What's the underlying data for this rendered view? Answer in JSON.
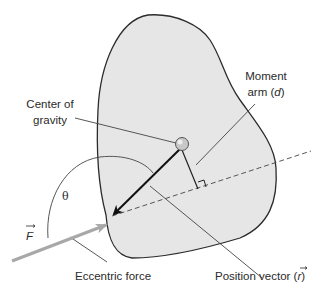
{
  "diagram": {
    "type": "torque-on-rigid-body",
    "colors": {
      "body_fill": "#e6e6e6",
      "outline": "#2b2b2b",
      "force_arrow": "#a8a8a8",
      "position_vector": "#111111",
      "leader_lines": "#444444",
      "cog_fill": "#c8c8c8"
    },
    "labels": {
      "center_of_gravity_line1": "Center of",
      "center_of_gravity_line2": "gravity",
      "moment_arm_line1": "Moment",
      "moment_arm_prefix": "arm (",
      "moment_arm_symbol": "d",
      "moment_arm_suffix": ")",
      "theta": "θ",
      "force_symbol": "F",
      "eccentric_force": "Eccentric force",
      "position_vector_prefix": "Position vector (",
      "position_vector_symbol": "r",
      "position_vector_suffix": ")"
    },
    "elements": [
      {
        "name": "irregular-body",
        "shape": "closed-curve"
      },
      {
        "name": "center-of-gravity",
        "shape": "circle"
      },
      {
        "name": "position-vector-arrow",
        "shape": "arrow",
        "from": "center of gravity",
        "to": "point of force application"
      },
      {
        "name": "force-arrow",
        "shape": "arrow",
        "label": "F"
      },
      {
        "name": "line-of-action",
        "shape": "dashed-line"
      },
      {
        "name": "moment-arm",
        "shape": "line",
        "perpendicular": true
      },
      {
        "name": "angle-arc",
        "shape": "arc",
        "label": "θ"
      }
    ]
  }
}
